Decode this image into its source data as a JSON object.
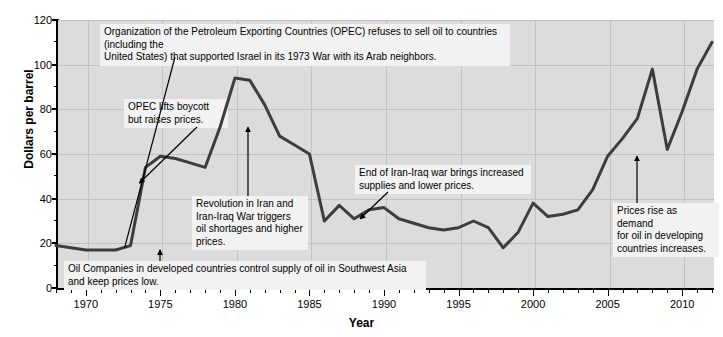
{
  "chart_data": {
    "type": "line",
    "title": "",
    "xlabel": "Year",
    "ylabel": "Dollars per barrel",
    "xlim": [
      1968,
      2012
    ],
    "ylim": [
      0,
      120
    ],
    "yticks": [
      0,
      20,
      40,
      60,
      80,
      100,
      120
    ],
    "yticks_minor_step": 10,
    "xticks_major": [
      1970,
      1975,
      1980,
      1985,
      1990,
      1995,
      2000,
      2005,
      2010
    ],
    "xticks_minor_step": 1,
    "grid": true,
    "legend": "none",
    "line_color": "#3d3d3d",
    "plot_background": "#dcdcdc",
    "series": [
      {
        "name": "Crude oil price (dollars per barrel)",
        "x": [
          1968,
          1969,
          1970,
          1971,
          1972,
          1973,
          1974,
          1975,
          1976,
          1977,
          1978,
          1979,
          1980,
          1981,
          1982,
          1983,
          1984,
          1985,
          1986,
          1987,
          1988,
          1989,
          1990,
          1991,
          1992,
          1993,
          1994,
          1995,
          1996,
          1997,
          1998,
          1999,
          2000,
          2001,
          2002,
          2003,
          2004,
          2005,
          2006,
          2007,
          2008,
          2009,
          2010,
          2011,
          2012
        ],
        "y": [
          19,
          18,
          17,
          17,
          17,
          19,
          54,
          59,
          58,
          56,
          54,
          72,
          94,
          93,
          82,
          68,
          64,
          60,
          30,
          37,
          31,
          35,
          36,
          31,
          29,
          27,
          26,
          27,
          30,
          27,
          18,
          25,
          38,
          32,
          33,
          35,
          44,
          59,
          67,
          76,
          98,
          62,
          79,
          98,
          110
        ]
      }
    ],
    "annotations": [
      {
        "id": "opec-embargo",
        "text": "Organization of the Petroleum Exporting Countries (OPEC) refuses to sell oil to countries (including the\nUnited States) that supported Israel in its 1973 War with its Arab neighbors.",
        "points_to_year": 1972.6,
        "points_to_value": 18
      },
      {
        "id": "opec-lifts-boycott",
        "text": "OPEC lifts boycott\nbut raises prices.",
        "points_to_year": 1973.6,
        "points_to_value": 47
      },
      {
        "id": "iran-revolution",
        "text": "Revolution in Iran and\nIran-Iraq War triggers\noil shortages and higher\nprices.",
        "points_to_year": 1978.6,
        "points_to_value": 72
      },
      {
        "id": "iran-iraq-war-end",
        "text": "End of Iran-Iraq war brings increased\nsupplies and lower prices.",
        "points_to_year": 1988.4,
        "points_to_value": 31
      },
      {
        "id": "developing-demand",
        "text": "Prices rise as demand\nfor oil in developing\ncountries increases.",
        "points_to_year": 2005.2,
        "points_to_value": 59
      },
      {
        "id": "oil-companies-control",
        "text": "Oil Companies in developed countries control supply of oil in Southwest Asia and keep prices low.",
        "points_to_year": 1970.2,
        "points_to_value": 17
      }
    ]
  }
}
